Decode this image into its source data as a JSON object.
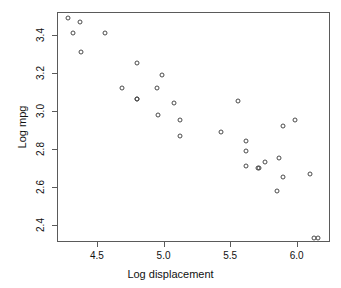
{
  "chart_data": {
    "type": "scatter",
    "title": "",
    "xlabel": "Log displacement",
    "ylabel": "Log mpg",
    "xlim": [
      4.2,
      6.25
    ],
    "ylim": [
      2.31,
      3.52
    ],
    "grid": false,
    "legend": null,
    "xticks": [
      4.5,
      5.0,
      5.5,
      6.0
    ],
    "xticklabels": [
      "4.5",
      "5.0",
      "5.5",
      "6.0"
    ],
    "yticks": [
      2.4,
      2.6,
      2.8,
      3.0,
      3.2,
      3.4
    ],
    "yticklabels": [
      "2.4",
      "2.6",
      "2.8",
      "3.0",
      "3.2",
      "3.4"
    ],
    "marker": "open-circle",
    "marker_color": "#4a4a4a",
    "points": [
      {
        "x": 4.28,
        "y": 3.49
      },
      {
        "x": 4.37,
        "y": 3.47
      },
      {
        "x": 4.32,
        "y": 3.41
      },
      {
        "x": 4.56,
        "y": 3.41
      },
      {
        "x": 4.38,
        "y": 3.31
      },
      {
        "x": 4.8,
        "y": 3.25
      },
      {
        "x": 4.99,
        "y": 3.19
      },
      {
        "x": 4.69,
        "y": 3.12
      },
      {
        "x": 4.95,
        "y": 3.12
      },
      {
        "x": 5.08,
        "y": 3.04
      },
      {
        "x": 4.8,
        "y": 3.06
      },
      {
        "x": 4.8,
        "y": 3.06
      },
      {
        "x": 5.56,
        "y": 3.05
      },
      {
        "x": 4.96,
        "y": 2.98
      },
      {
        "x": 5.12,
        "y": 2.95
      },
      {
        "x": 5.99,
        "y": 2.95
      },
      {
        "x": 5.9,
        "y": 2.92
      },
      {
        "x": 5.43,
        "y": 2.89
      },
      {
        "x": 5.12,
        "y": 2.87
      },
      {
        "x": 5.62,
        "y": 2.84
      },
      {
        "x": 5.62,
        "y": 2.79
      },
      {
        "x": 5.87,
        "y": 2.75
      },
      {
        "x": 5.76,
        "y": 2.73
      },
      {
        "x": 5.62,
        "y": 2.71
      },
      {
        "x": 5.71,
        "y": 2.7
      },
      {
        "x": 5.72,
        "y": 2.7
      },
      {
        "x": 6.1,
        "y": 2.67
      },
      {
        "x": 5.9,
        "y": 2.65
      },
      {
        "x": 5.85,
        "y": 2.58
      },
      {
        "x": 6.13,
        "y": 2.33
      },
      {
        "x": 6.16,
        "y": 2.33
      }
    ]
  }
}
